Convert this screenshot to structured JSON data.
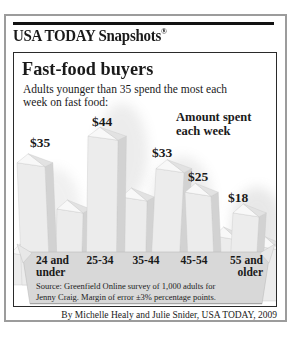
{
  "header": {
    "brand": "USA TODAY Snapshots",
    "registered": "®"
  },
  "chart": {
    "title": "Fast-food buyers",
    "subtitle": "Adults younger than 35 spend the most each week on fast food:",
    "annotation": "Amount spent each week",
    "source_line1": "Source: Greenfield Online survey of 1,000 adults for",
    "source_line2": "Jenny Craig. Margin of error ±3% percentage points."
  },
  "byline": "By Michelle Healy and Julie Snider, USA TODAY, 2009",
  "chart_data": {
    "type": "bar",
    "title": "Fast-food buyers",
    "subtitle": "Adults younger than 35 spend the most each week on fast food:",
    "annotation": "Amount spent each week",
    "categories": [
      "24 and under",
      "25-34",
      "35-44",
      "45-54",
      "55 and older"
    ],
    "values": [
      35,
      44,
      33,
      25,
      18
    ],
    "value_labels": [
      "$35",
      "$44",
      "$33",
      "$25",
      "$18"
    ],
    "ylabel": "Amount spent each week ($)",
    "ylim": [
      0,
      50
    ],
    "grid": false,
    "legend": false,
    "style": "3d french-fry pictograph bars rising from a fry carton"
  },
  "colors": {
    "text": "#1a1a1a",
    "frame_border": "#9c9c9c",
    "panel_border": "#2a2a2a",
    "fry_front": "#ececec",
    "fry_side": "#d2d2d2",
    "fry_top_light": "#f8f8f8",
    "fry_top_mid": "#e2e2e2",
    "fry_edge": "#c8c8c8",
    "tray": "#d8d8d8",
    "tray_edge": "#bdbdbd",
    "shadow": "#8f8f8f"
  }
}
